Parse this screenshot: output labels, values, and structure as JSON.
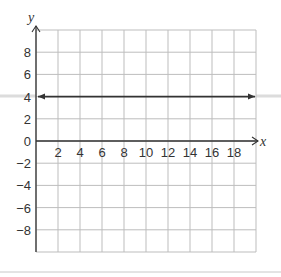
{
  "chart_data": {
    "type": "line",
    "title": "",
    "xlabel": "x",
    "ylabel": "y",
    "xlim": [
      0,
      20
    ],
    "ylim": [
      -10,
      10
    ],
    "grid": true,
    "grid_step": 2,
    "x_ticks": [
      2,
      4,
      6,
      8,
      10,
      12,
      14,
      16,
      18
    ],
    "y_ticks": [
      8,
      6,
      4,
      2,
      0,
      -2,
      -4,
      -6,
      -8
    ],
    "series": [
      {
        "name": "y = 4",
        "x": [
          0,
          20
        ],
        "values": [
          4,
          4
        ],
        "arrows": "both",
        "color": "#333333"
      }
    ],
    "legend": null
  },
  "colors": {
    "grid": "#bdbdbd",
    "axis": "#333333",
    "line": "#333333",
    "band": "#dcdcdc",
    "divider": "#c8c8c8"
  }
}
